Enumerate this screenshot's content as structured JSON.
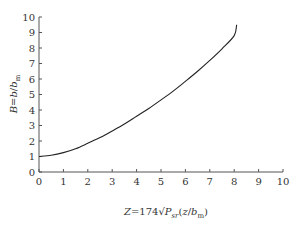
{
  "chart_data": {
    "type": "line",
    "title": "",
    "xlabel": "Z = 174√P_sr (z / b_m)",
    "ylabel": "B = b / b_m",
    "xlim": [
      0,
      10
    ],
    "ylim": [
      0,
      10
    ],
    "x_ticks": [
      "0",
      "1",
      "2",
      "3",
      "4",
      "5",
      "6",
      "7",
      "8",
      "9",
      "10"
    ],
    "y_ticks": [
      "0",
      "1",
      "2",
      "3",
      "4",
      "5",
      "6",
      "7",
      "8",
      "9",
      "10"
    ],
    "grid": false,
    "legend": null,
    "series": [
      {
        "name": "B(Z)",
        "color": "#222222",
        "x": [
          0,
          0.5,
          1,
          1.5,
          2,
          2.5,
          3,
          3.5,
          4,
          4.5,
          5,
          5.5,
          6,
          6.5,
          7,
          7.5,
          8,
          8.1
        ],
        "y": [
          1.0,
          1.08,
          1.25,
          1.5,
          1.85,
          2.22,
          2.65,
          3.1,
          3.6,
          4.1,
          4.65,
          5.22,
          5.85,
          6.5,
          7.2,
          7.95,
          8.8,
          9.5
        ]
      }
    ]
  }
}
